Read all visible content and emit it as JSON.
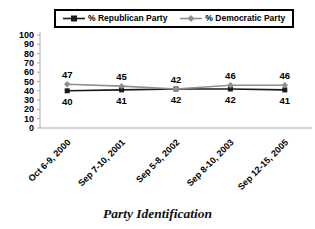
{
  "title": "Party Identification",
  "colors": {
    "republican": "#1a1a1a",
    "democratic": "#8f8f8f",
    "axis": "#aaaaaa",
    "text": "#000000",
    "legend_border": "#000000"
  },
  "legend": {
    "position": "top",
    "items": [
      {
        "label": "% Republican Party",
        "marker": "square"
      },
      {
        "label": "% Democratic Party",
        "marker": "diamond"
      }
    ]
  },
  "chart_data": {
    "type": "line",
    "categories": [
      "Oct 6-9, 2000",
      "Sep 7-10, 2001",
      "Sep 5-8, 2002",
      "Sep 8-10, 2003",
      "Sep 12-15, 2005"
    ],
    "series": [
      {
        "name": "% Republican Party",
        "values": [
          40,
          41,
          42,
          42,
          41
        ],
        "color": "#1a1a1a",
        "marker": "square",
        "label_position": "below"
      },
      {
        "name": "% Democratic Party",
        "values": [
          47,
          45,
          42,
          46,
          46
        ],
        "color": "#8f8f8f",
        "marker": "diamond",
        "label_position": "above"
      }
    ],
    "title": "Party Identification",
    "xlabel": "",
    "ylabel": "",
    "ylim": [
      0,
      100
    ],
    "yticks": [
      0,
      10,
      20,
      30,
      40,
      50,
      60,
      70,
      80,
      90,
      100
    ],
    "grid": false,
    "legend_position": "top"
  }
}
